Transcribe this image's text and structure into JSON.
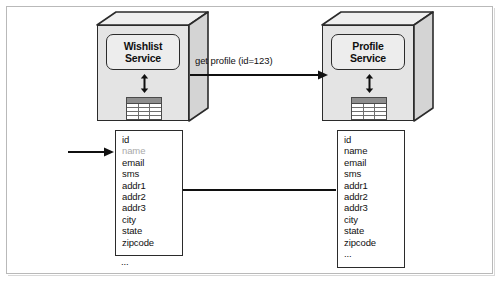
{
  "diagram": {
    "accent_dark": "#2b2b2b",
    "box_fill": "#e4e4e4",
    "label_fill": "#ededed",
    "dim_text": "#a9a9a9"
  },
  "services": [
    {
      "id": "wishlist",
      "name_line1": "Wishlist",
      "name_line2": "Service",
      "datastore_icon": "database-table-icon",
      "link_icon": "vertical-double-arrow-icon"
    },
    {
      "id": "profile",
      "name_line1": "Profile",
      "name_line2": "Service",
      "datastore_icon": "database-table-icon",
      "link_icon": "vertical-double-arrow-icon"
    }
  ],
  "request": {
    "label": "get profile (id=123)",
    "direction": "left-to-right",
    "arrow_icon": "arrow-right-icon"
  },
  "response": {
    "direction": "right-to-left",
    "arrow_icon": "arrow-left-icon"
  },
  "pointer": {
    "target_field": "name",
    "arrow_icon": "arrow-right-icon"
  },
  "field_lists": [
    {
      "id": "wishlist-fields",
      "ellipsis_inside": false,
      "ellipsis": "...",
      "fields": [
        {
          "label": "id",
          "dimmed": false
        },
        {
          "label": "name",
          "dimmed": true
        },
        {
          "label": "email",
          "dimmed": false
        },
        {
          "label": "sms",
          "dimmed": false
        },
        {
          "label": "addr1",
          "dimmed": false
        },
        {
          "label": "addr2",
          "dimmed": false
        },
        {
          "label": "addr3",
          "dimmed": false
        },
        {
          "label": "city",
          "dimmed": false
        },
        {
          "label": "state",
          "dimmed": false
        },
        {
          "label": "zipcode",
          "dimmed": false
        }
      ]
    },
    {
      "id": "profile-fields",
      "ellipsis_inside": true,
      "ellipsis": "...",
      "fields": [
        {
          "label": "id",
          "dimmed": false
        },
        {
          "label": "name",
          "dimmed": false
        },
        {
          "label": "email",
          "dimmed": false
        },
        {
          "label": "sms",
          "dimmed": false
        },
        {
          "label": "addr1",
          "dimmed": false
        },
        {
          "label": "addr2",
          "dimmed": false
        },
        {
          "label": "addr3",
          "dimmed": false
        },
        {
          "label": "city",
          "dimmed": false
        },
        {
          "label": "state",
          "dimmed": false
        },
        {
          "label": "zipcode",
          "dimmed": false
        }
      ]
    }
  ]
}
